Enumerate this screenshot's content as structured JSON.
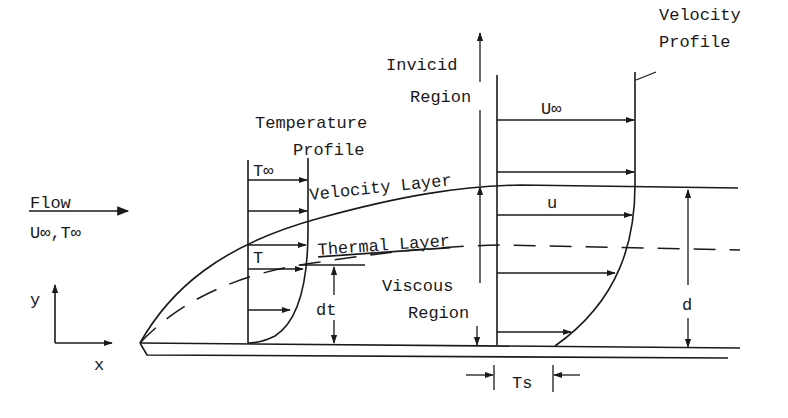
{
  "diagram": {
    "flow": {
      "label": "Flow",
      "conditions": "U∞,T∞"
    },
    "axes": {
      "y_label": "y",
      "x_label": "x"
    },
    "temperature_profile": {
      "title_line1": "Temperature",
      "title_line2": "Profile",
      "t_inf": "T∞",
      "t": "T"
    },
    "layers": {
      "velocity_layer": "Velocity Layer",
      "thermal_layer": "Thermal Layer"
    },
    "regions": {
      "invicid_line1": "Invicid",
      "invicid_line2": "Region",
      "viscous_line1": "Viscous",
      "viscous_line2": "Region"
    },
    "velocity_profile": {
      "title_line1": "Velocity",
      "title_line2": "Profile",
      "u_inf": "U∞",
      "u": "u"
    },
    "dimensions": {
      "thermal_thickness": "dt",
      "velocity_thickness": "d",
      "ts": "Ts"
    }
  }
}
